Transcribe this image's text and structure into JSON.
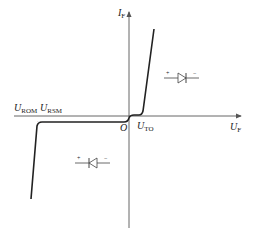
{
  "diagram": {
    "type": "diode-iv-characteristic",
    "axes": {
      "y_label": {
        "main": "I",
        "sub": "F"
      },
      "x_label": {
        "main": "U",
        "sub": "F"
      },
      "origin_label": "O"
    },
    "annotations": {
      "threshold": {
        "main": "U",
        "sub": "TO"
      },
      "reverse_repetitive": {
        "main": "U",
        "sub": "ROM"
      },
      "reverse_surge": {
        "main": "U",
        "sub": "RSM"
      }
    },
    "diode_forward": {
      "plus": "+",
      "minus": "−",
      "orientation": "forward"
    },
    "diode_reverse": {
      "plus": "+",
      "minus": "−",
      "orientation": "reverse"
    },
    "colors": {
      "axis": "#555555",
      "curve": "#222222"
    }
  }
}
